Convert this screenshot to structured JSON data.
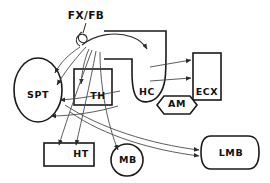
{
  "figure": {
    "type": "neuroanatomy-circuit-diagram",
    "width": 270,
    "height": 183,
    "background_color": "#ffffff",
    "line_color": "#2b2b2b",
    "connector_color": "#4a4a4a"
  },
  "nodes": [
    {
      "id": "SPT",
      "label": "SPT",
      "shape": "ellipse",
      "label_x": 38,
      "label_y": 95
    },
    {
      "id": "TH",
      "label": "TH",
      "shape": "rectangle",
      "label_x": 98,
      "label_y": 96
    },
    {
      "id": "HC",
      "label": "HC",
      "shape": "hook",
      "label_x": 147,
      "label_y": 92
    },
    {
      "id": "ECX",
      "label": "ECX",
      "shape": "rectangle-vertical",
      "label_x": 207,
      "label_y": 92
    },
    {
      "id": "AM",
      "label": "AM",
      "shape": "hexagon",
      "label_x": 177,
      "label_y": 104
    },
    {
      "id": "HT",
      "label": "HT",
      "shape": "rectangle",
      "label_x": 81,
      "label_y": 154
    },
    {
      "id": "MB",
      "label": "MB",
      "shape": "circle",
      "label_x": 128,
      "label_y": 160
    },
    {
      "id": "LMB",
      "label": "LMB",
      "shape": "rounded-cylinder",
      "label_x": 231,
      "label_y": 153
    }
  ],
  "bundle": {
    "id": "FX_FB",
    "label": "FX/FB",
    "label_x": 86,
    "label_y": 16
  },
  "connections": [
    {
      "from": "FX_FB",
      "to": "HC"
    },
    {
      "from": "HC",
      "to": "ECX"
    },
    {
      "from": "HC",
      "to": "ECX"
    },
    {
      "from": "FX_FB",
      "to": "SPT"
    },
    {
      "from": "FX_FB",
      "to": "SPT"
    },
    {
      "from": "FX_FB",
      "to": "SPT"
    },
    {
      "from": "FX_FB",
      "to": "SPT"
    },
    {
      "from": "FX_FB",
      "to": "TH"
    },
    {
      "from": "FX_FB",
      "to": "HT"
    },
    {
      "from": "FX_FB",
      "to": "HT"
    },
    {
      "from": "FX_FB",
      "to": "MB"
    },
    {
      "from": "FX_FB",
      "to": "LMB"
    },
    {
      "from": "FX_FB",
      "to": "LMB"
    }
  ]
}
